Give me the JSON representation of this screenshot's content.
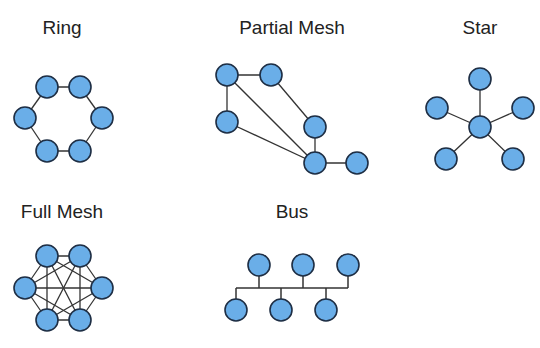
{
  "diagram": {
    "node_fill": "#6aaee8",
    "node_stroke": "#1e2e44",
    "edge_color": "#333333",
    "node_radius": 11,
    "topologies": [
      {
        "id": "ring",
        "title": "Ring",
        "title_pos": [
          62,
          28
        ],
        "nodes": [
          [
            47,
            87
          ],
          [
            80,
            87
          ],
          [
            102,
            118
          ],
          [
            80,
            151
          ],
          [
            47,
            151
          ],
          [
            25,
            118
          ]
        ],
        "edges": [
          [
            0,
            1
          ],
          [
            1,
            2
          ],
          [
            2,
            3
          ],
          [
            3,
            4
          ],
          [
            4,
            5
          ],
          [
            5,
            0
          ]
        ]
      },
      {
        "id": "partial-mesh",
        "title": "Partial Mesh",
        "title_pos": [
          292,
          28
        ],
        "nodes": [
          [
            227,
            75
          ],
          [
            271,
            75
          ],
          [
            227,
            122
          ],
          [
            315,
            127
          ],
          [
            315,
            163
          ],
          [
            357,
            163
          ]
        ],
        "edges": [
          [
            0,
            1
          ],
          [
            0,
            2
          ],
          [
            0,
            4
          ],
          [
            1,
            3
          ],
          [
            3,
            4
          ],
          [
            2,
            4
          ],
          [
            4,
            5
          ]
        ]
      },
      {
        "id": "star",
        "title": "Star",
        "title_pos": [
          480,
          28
        ],
        "nodes": [
          [
            480,
            127
          ],
          [
            480,
            79
          ],
          [
            437,
            108
          ],
          [
            523,
            108
          ],
          [
            446,
            159
          ],
          [
            513,
            159
          ]
        ],
        "edges": [
          [
            0,
            1
          ],
          [
            0,
            2
          ],
          [
            0,
            3
          ],
          [
            0,
            4
          ],
          [
            0,
            5
          ]
        ]
      },
      {
        "id": "full-mesh",
        "title": "Full Mesh",
        "title_pos": [
          62,
          212
        ],
        "nodes": [
          [
            47,
            256
          ],
          [
            80,
            256
          ],
          [
            102,
            288
          ],
          [
            80,
            320
          ],
          [
            47,
            320
          ],
          [
            25,
            288
          ]
        ],
        "edges": [
          [
            0,
            1
          ],
          [
            0,
            2
          ],
          [
            0,
            3
          ],
          [
            0,
            4
          ],
          [
            0,
            5
          ],
          [
            1,
            2
          ],
          [
            1,
            3
          ],
          [
            1,
            4
          ],
          [
            1,
            5
          ],
          [
            2,
            3
          ],
          [
            2,
            4
          ],
          [
            2,
            5
          ],
          [
            3,
            4
          ],
          [
            3,
            5
          ],
          [
            4,
            5
          ]
        ]
      },
      {
        "id": "bus",
        "title": "Bus",
        "title_pos": [
          292,
          212
        ],
        "nodes": [
          [
            259,
            265
          ],
          [
            303,
            265
          ],
          [
            348,
            265
          ],
          [
            236,
            310
          ],
          [
            281,
            310
          ],
          [
            326,
            310
          ]
        ],
        "bus_line": {
          "y": 288,
          "x1": 236,
          "x2": 348
        }
      }
    ]
  }
}
